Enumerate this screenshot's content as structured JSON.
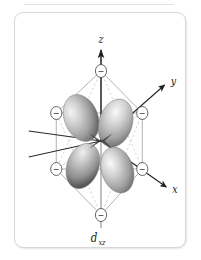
{
  "figure": {
    "kind": "orbital-crystal-field-diagram",
    "orbital_label": "d",
    "orbital_subscript": "xz",
    "frame_color": "#d8d8d8",
    "background": "#ffffff"
  },
  "axes": [
    {
      "name": "z",
      "label": "z",
      "direction": "up",
      "label_x": 100,
      "label_y": 27
    },
    {
      "name": "y",
      "label": "y",
      "direction": "upper-right",
      "label_x": 182,
      "label_y": 79
    },
    {
      "name": "x",
      "label": "x",
      "direction": "lower-right",
      "label_x": 184,
      "label_y": 180
    }
  ],
  "ligands": [
    {
      "name": "ligand-top",
      "charge": "−",
      "cx": 100,
      "cy": 58,
      "r": 6.5
    },
    {
      "name": "ligand-bottom",
      "charge": "−",
      "cx": 100,
      "cy": 202,
      "r": 6.5
    },
    {
      "name": "ligand-upper-left",
      "charge": "−",
      "cx": 48,
      "cy": 100,
      "r": 6.5
    },
    {
      "name": "ligand-upper-right",
      "charge": "−",
      "cx": 148,
      "cy": 100,
      "r": 6.5
    },
    {
      "name": "ligand-lower-left",
      "charge": "−",
      "cx": 48,
      "cy": 156,
      "r": 6.5
    },
    {
      "name": "ligand-lower-right",
      "charge": "−",
      "cx": 148,
      "cy": 156,
      "r": 6.5
    }
  ],
  "orbital": {
    "type": "d-xz",
    "lobe_count": 4,
    "lobe_color_light": "#f2f2f2",
    "lobe_color_mid": "#b2b2b2",
    "lobe_color_dark": "#5a5a5a",
    "center_x": 100,
    "center_y": 128,
    "lobes": [
      {
        "name": "lobe-upper-left",
        "angle_deg": -128
      },
      {
        "name": "lobe-upper-right",
        "angle_deg": -52
      },
      {
        "name": "lobe-lower-left",
        "angle_deg": 128
      },
      {
        "name": "lobe-lower-right",
        "angle_deg": 52
      }
    ]
  },
  "wireframe": {
    "solid_color": "#9a9a9a",
    "dashed_color": "#b6b6b6",
    "axis_color": "#2a2a2a"
  },
  "caption": {
    "base": "d",
    "subscript": "xz"
  }
}
